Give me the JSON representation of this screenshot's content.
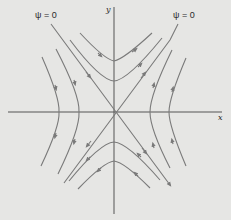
{
  "diagram": {
    "title": "",
    "type": "streamlines-hyperbolic-flow",
    "colors": {
      "background": "#e6e6e4",
      "axes": "#555555",
      "streamlines": "#7a7a7a",
      "text": "#2a2a2a"
    },
    "axes": {
      "x_label": "x",
      "y_label": "y",
      "origin": [
        114,
        112
      ]
    },
    "labels": {
      "psi_left": "ψ = 0",
      "psi_right": "ψ = 0"
    },
    "asymptotes": [
      {
        "name": "psi-zero-line-negative-slope",
        "from": [
          51,
          24
        ],
        "to": [
          170,
          185
        ],
        "label": "ψ = 0"
      },
      {
        "name": "psi-zero-line-positive-slope",
        "from": [
          178,
          24
        ],
        "to": [
          64,
          183
        ],
        "label": "ψ = 0"
      }
    ],
    "streamlines": [
      {
        "name": "top-inner",
        "vertex": [
          114,
          61
        ],
        "direction": "left-to-right"
      },
      {
        "name": "top-outer",
        "vertex": [
          114,
          81
        ],
        "direction": "left-to-right"
      },
      {
        "name": "bottom-inner",
        "vertex": [
          114,
          142
        ],
        "direction": "right-to-left"
      },
      {
        "name": "bottom-outer",
        "vertex": [
          114,
          161
        ],
        "direction": "right-to-left"
      },
      {
        "name": "left-inner",
        "vertex": [
          79,
          112
        ],
        "direction": "top-to-bottom"
      },
      {
        "name": "left-outer",
        "vertex": [
          59,
          112
        ],
        "direction": "top-to-bottom"
      },
      {
        "name": "right-inner",
        "vertex": [
          150,
          112
        ],
        "direction": "bottom-to-top"
      },
      {
        "name": "right-outer",
        "vertex": [
          169,
          112
        ],
        "direction": "bottom-to-top"
      }
    ]
  }
}
